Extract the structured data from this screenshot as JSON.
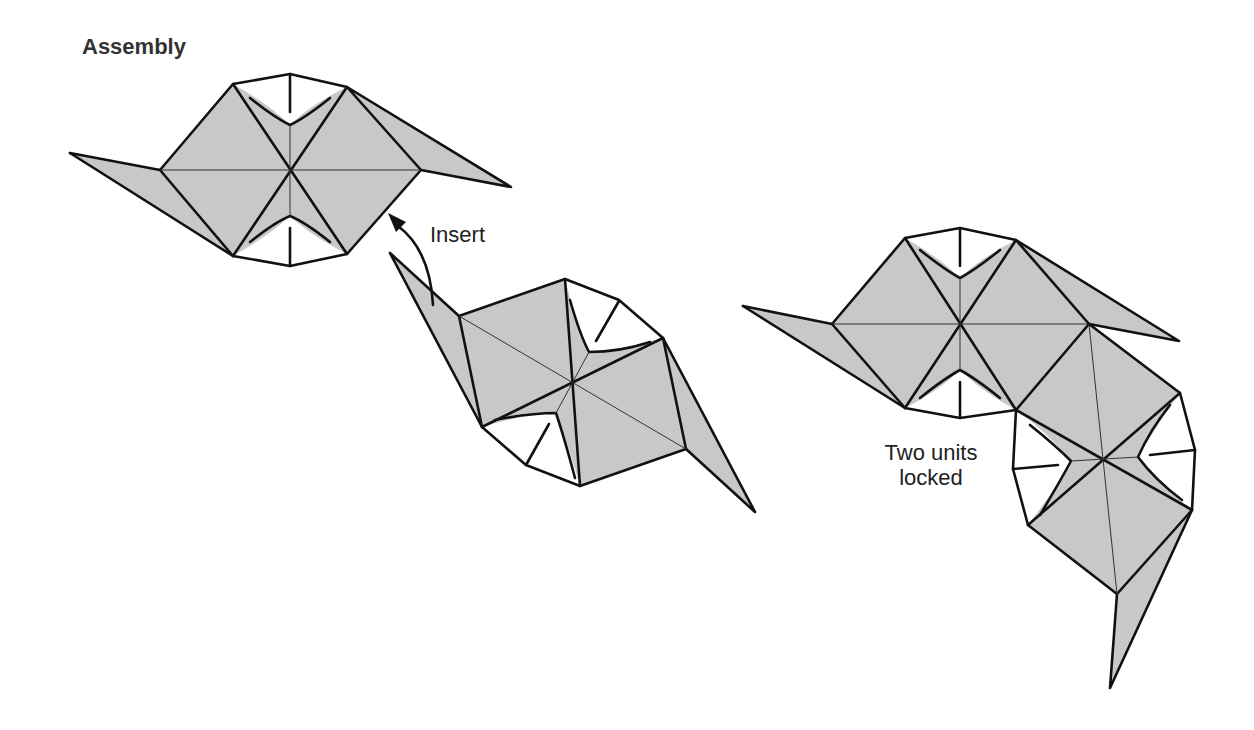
{
  "title": "Assembly",
  "labels": {
    "insert": "Insert",
    "locked_line1": "Two units",
    "locked_line2": "locked"
  },
  "colors": {
    "paper_fill": "#c8c8c8",
    "line": "#111111",
    "background": "#ffffff"
  }
}
